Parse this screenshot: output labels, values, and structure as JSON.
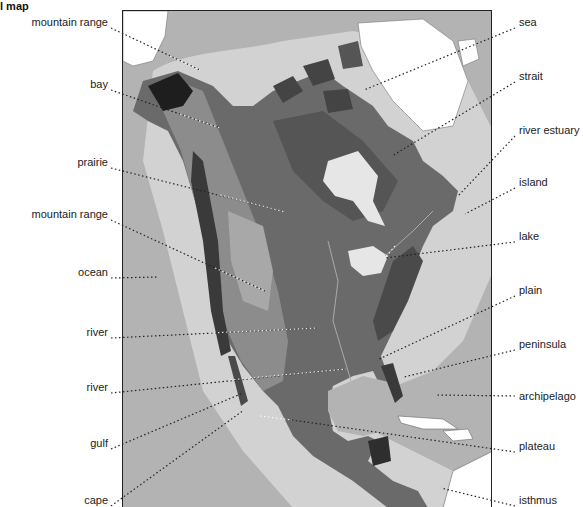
{
  "title": "l map",
  "map": {
    "subject": "North America relief map",
    "colors": {
      "ocean": "#b3b3b3",
      "shelf": "#d2d2d2",
      "ice": "#ffffff",
      "lowland": "#6a6a6a",
      "upland": "#8c8c8c",
      "mountain": "#3a3a3a",
      "plateau_light": "#a8a8a8",
      "frame": "#222222",
      "leader_line": "#222222"
    }
  },
  "labels_left": [
    {
      "text": "mountain range",
      "x": 108,
      "y": 22,
      "target": [
        200,
        70
      ]
    },
    {
      "text": "bay",
      "x": 108,
      "y": 84,
      "target": [
        220,
        128
      ]
    },
    {
      "text": "prairie",
      "x": 108,
      "y": 162,
      "target": [
        285,
        212
      ]
    },
    {
      "text": "mountain range",
      "x": 108,
      "y": 214,
      "target": [
        265,
        291
      ]
    },
    {
      "text": "ocean",
      "x": 108,
      "y": 272,
      "target": [
        158,
        277
      ]
    },
    {
      "text": "river",
      "x": 108,
      "y": 332,
      "target": [
        318,
        328
      ]
    },
    {
      "text": "river",
      "x": 108,
      "y": 387,
      "target": [
        346,
        369
      ]
    },
    {
      "text": "gulf",
      "x": 108,
      "y": 443,
      "target": [
        243,
        393
      ]
    },
    {
      "text": "cape",
      "x": 108,
      "y": 500,
      "target": [
        244,
        410
      ]
    }
  ],
  "labels_right": [
    {
      "text": "sea",
      "x": 519,
      "y": 22,
      "target": [
        364,
        90
      ]
    },
    {
      "text": "strait",
      "x": 519,
      "y": 76,
      "target": [
        392,
        156
      ]
    },
    {
      "text": "river estuary",
      "x": 519,
      "y": 130,
      "target": [
        458,
        196
      ]
    },
    {
      "text": "island",
      "x": 519,
      "y": 182,
      "target": [
        465,
        214
      ]
    },
    {
      "text": "lake",
      "x": 519,
      "y": 236,
      "target": [
        385,
        258
      ]
    },
    {
      "text": "plain",
      "x": 519,
      "y": 290,
      "target": [
        377,
        360
      ]
    },
    {
      "text": "peninsula",
      "x": 519,
      "y": 344,
      "target": [
        404,
        377
      ]
    },
    {
      "text": "archipelago",
      "x": 519,
      "y": 396,
      "target": [
        437,
        395
      ]
    },
    {
      "text": "plateau",
      "x": 519,
      "y": 446,
      "target": [
        292,
        420
      ]
    },
    {
      "text": "isthmus",
      "x": 519,
      "y": 500,
      "target": [
        441,
        488
      ]
    }
  ]
}
